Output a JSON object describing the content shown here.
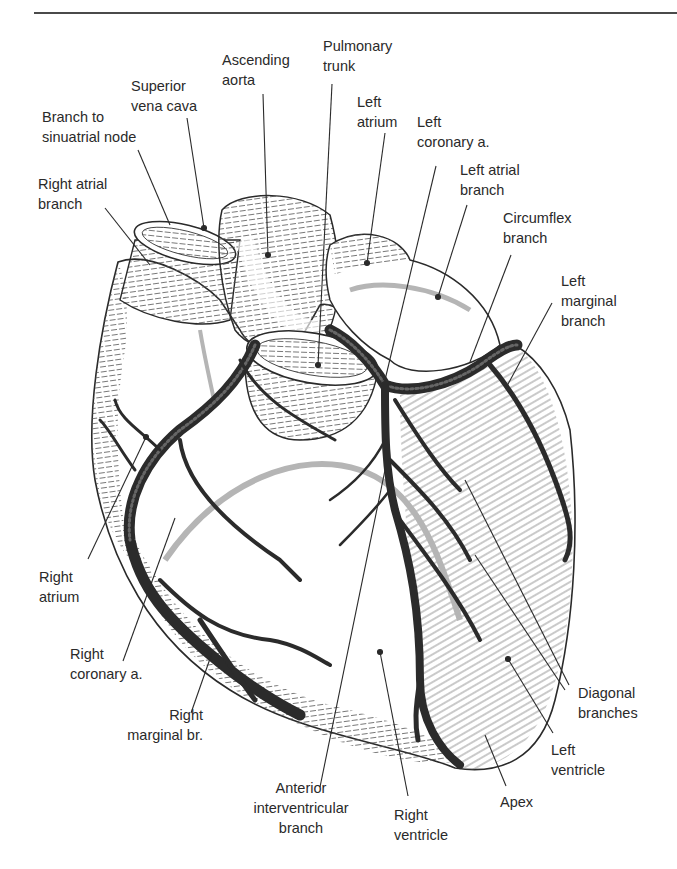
{
  "figure": {
    "colors": {
      "ink": "#2a2a2a",
      "vessel": "#2b2b2b",
      "hatch": "#555555",
      "posterior_vessel": "#b5b5b5",
      "background": "#ffffff"
    }
  },
  "labels": {
    "ascending_aorta": {
      "line1": "Ascending",
      "line2": "aorta"
    },
    "pulmonary_trunk": {
      "line1": "Pulmonary",
      "line2": "trunk"
    },
    "superior_vena_cava": {
      "line1": "Superior",
      "line2": "vena cava"
    },
    "branch_to_sa_node": {
      "line1": "Branch to",
      "line2": "sinuatrial node"
    },
    "right_atrial_branch": {
      "line1": "Right atrial",
      "line2": "branch"
    },
    "left_atrium": {
      "line1": "Left",
      "line2": "atrium"
    },
    "left_coronary": {
      "line1": "Left",
      "line2": "coronary a."
    },
    "left_atrial_branch": {
      "line1": "Left atrial",
      "line2": "branch"
    },
    "circumflex_branch": {
      "line1": "Circumflex",
      "line2": "branch"
    },
    "left_marginal_branch": {
      "line1": "Left",
      "line2": "marginal",
      "line3": "branch"
    },
    "right_atrium": {
      "line1": "Right",
      "line2": "atrium"
    },
    "right_coronary": {
      "line1": "Right",
      "line2": "coronary a."
    },
    "right_marginal": {
      "line1": "Right",
      "line2": "marginal br."
    },
    "anterior_interventricular": {
      "line1": "Anterior",
      "line2": "interventricular",
      "line3": "branch"
    },
    "right_ventricle": {
      "line1": "Right",
      "line2": "ventricle"
    },
    "apex": {
      "line1": "Apex"
    },
    "left_ventricle": {
      "line1": "Left",
      "line2": "ventricle"
    },
    "diagonal_branches": {
      "line1": "Diagonal",
      "line2": "branches"
    }
  }
}
